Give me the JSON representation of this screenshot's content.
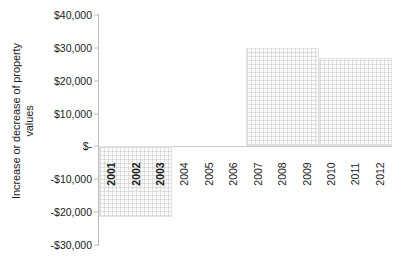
{
  "chart_data": {
    "type": "bar",
    "title": "",
    "subtitle": "",
    "xlabel": "",
    "ylabel": "Increase or decrease of property values",
    "ylabel_lines": [
      "Increase or decrease of property",
      "values"
    ],
    "categories": [
      "2001",
      "2002",
      "2003",
      "2004",
      "2005",
      "2006",
      "2007",
      "2008",
      "2009",
      "2010",
      "2011",
      "2012"
    ],
    "values": [
      -21500,
      -21500,
      -21500,
      0,
      0,
      0,
      30000,
      30000,
      30000,
      26800,
      26800,
      26800
    ],
    "series": [
      {
        "name": "Increase or decrease of property values",
        "values": [
          -21500,
          -21500,
          -21500,
          0,
          0,
          0,
          30000,
          30000,
          30000,
          26800,
          26800,
          26800
        ]
      }
    ],
    "ylim": [
      -30000,
      40000
    ],
    "ytick_values": [
      40000,
      30000,
      20000,
      10000,
      0,
      -10000,
      -20000,
      -30000
    ],
    "ytick_labels": [
      "$40,000",
      "$30,000",
      "$20,000",
      "$10,000",
      "$-",
      "-$10,000",
      "-$20,000",
      "-$30,000"
    ],
    "grid": false,
    "legend": false,
    "legend_position": "none",
    "bar_fill_color": "#fbfbfb",
    "bar_grid_color": "#c8c8c8",
    "bar_border_color": "#e2e2e2",
    "axis_color": "#bdbdbd",
    "text_color": "#1a1a1a",
    "xtick_rotation": -90,
    "bold_categories": [
      "2001",
      "2002",
      "2003"
    ],
    "bar_groups": [
      {
        "name": "group-2001-2003",
        "start_category": "2001",
        "end_category": "2003",
        "value": -21500
      },
      {
        "name": "group-2004-2006",
        "start_category": "2004",
        "end_category": "2006",
        "value": 0
      },
      {
        "name": "group-2007-2009",
        "start_category": "2007",
        "end_category": "2009",
        "value": 30000
      },
      {
        "name": "group-2010-2012",
        "start_category": "2010",
        "end_category": "2012",
        "value": 26800
      }
    ]
  }
}
